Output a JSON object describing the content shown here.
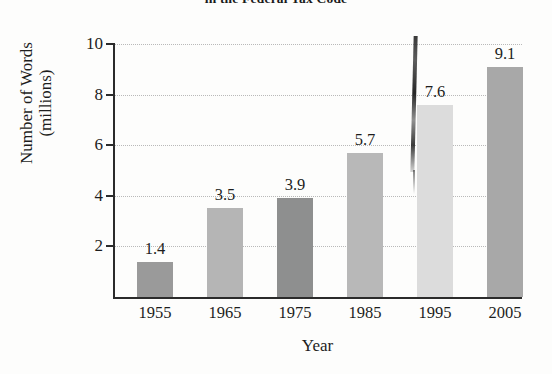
{
  "chart_data": {
    "type": "bar",
    "title": "in the Federal Tax Code",
    "xlabel": "Year",
    "ylabel": "Number of Words\n(millions)",
    "ylabel_line1": "Number of Words",
    "ylabel_line2": "(millions)",
    "categories": [
      "1955",
      "1965",
      "1975",
      "1985",
      "1995",
      "2005"
    ],
    "values": [
      1.4,
      3.5,
      3.9,
      5.7,
      7.6,
      9.1
    ],
    "value_labels": [
      "1.4",
      "3.5",
      "3.9",
      "5.7",
      "7.6",
      "9.1"
    ],
    "ylim": [
      0,
      10
    ],
    "ytick_labels": [
      "10",
      "8",
      "6",
      "4",
      "2"
    ],
    "ytick_values": [
      10,
      8,
      6,
      4,
      2
    ],
    "grid": true,
    "legend": "none",
    "bar_colors": [
      "#9a9a9a",
      "#b5b5b5",
      "#8e8f8f",
      "#b8b8b8",
      "#dcdcdc",
      "#a8a8a8"
    ],
    "axis_color": "#2b2b2b",
    "gridline_color": "#b9b9b9",
    "text_color": "#1d1d1d",
    "background_color": "#fdfdfc",
    "annotations": [
      "dark vertical scan streak over the 1995 bar"
    ]
  }
}
